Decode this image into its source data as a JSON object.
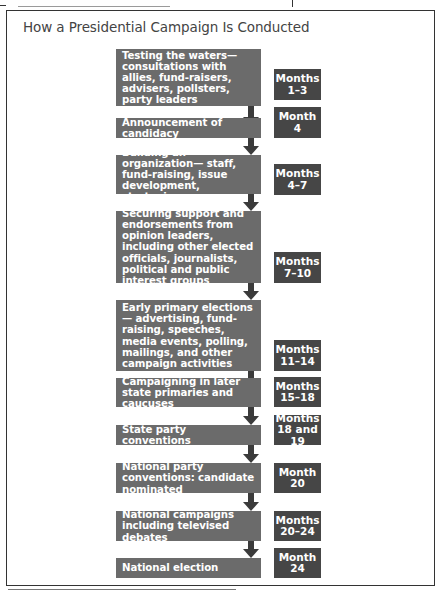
{
  "title": "How a Presidential Campaign Is Conducted",
  "colors": {
    "step_box": "#6b6b6b",
    "month_box": "#464646",
    "arrow": "#3b3b3b",
    "frame": "#333333"
  },
  "steps": [
    {
      "label": "Testing the waters— consultations with allies, fund-raisers, advisers, pollsters, party leaders",
      "months_label": "Months",
      "months_value": "1–3"
    },
    {
      "label": "Announcement of candidacy",
      "months_label": "Month",
      "months_value": "4"
    },
    {
      "label": "Building an organization— staff, fund-raising, issue development, strategies",
      "months_label": "Months",
      "months_value": "4–7"
    },
    {
      "label": "Securing support and endorsements from opinion leaders, including other elected officials, journalists, political and public interest groups",
      "months_label": "Months",
      "months_value": "7–10"
    },
    {
      "label": "Early primary elections— advertising, fund-raising, speeches, media events, polling, mailings, and other campaign activities",
      "months_label": "Months",
      "months_value": "11–14"
    },
    {
      "label": "Campaigning in later state primaries and caucuses",
      "months_label": "Months",
      "months_value": "15–18"
    },
    {
      "label": "State party conventions",
      "months_label": "Months",
      "months_value": "18 and 19"
    },
    {
      "label": "National party conventions: candidate nominated",
      "months_label": "Month",
      "months_value": "20"
    },
    {
      "label": "National campaigns including televised debates",
      "months_label": "Months",
      "months_value": "20–24"
    },
    {
      "label": "National election",
      "months_label": "Month",
      "months_value": "24"
    }
  ]
}
